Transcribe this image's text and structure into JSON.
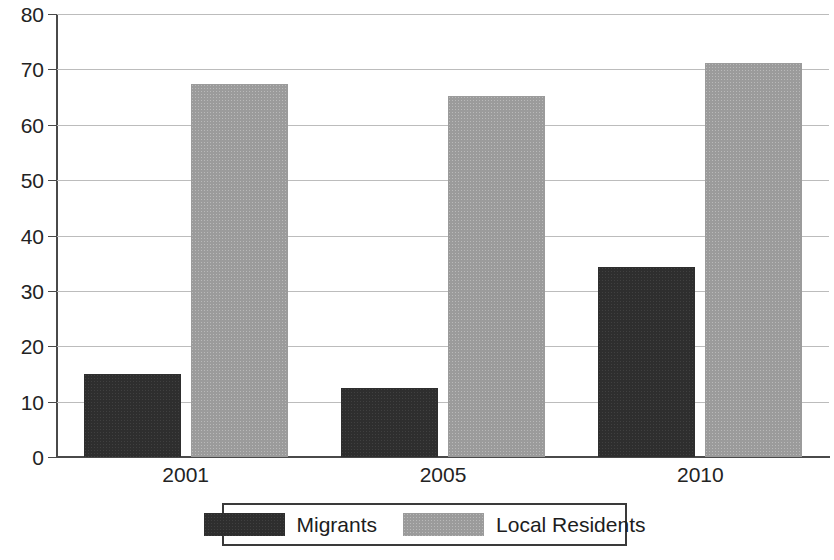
{
  "chart_data": {
    "type": "bar",
    "title": "",
    "subtitle": "",
    "xlabel": "",
    "ylabel": "",
    "categories": [
      "2001",
      "2005",
      "2010"
    ],
    "series": [
      {
        "name": "Migrants",
        "color": "#2e2e2e",
        "values": [
          15,
          12.5,
          34.3
        ]
      },
      {
        "name": "Local Residents",
        "color": "#9b9b9b",
        "values": [
          67.3,
          65.2,
          71.2
        ]
      }
    ],
    "ylim": [
      0,
      80
    ],
    "yticks": [
      0,
      10,
      20,
      30,
      40,
      50,
      60,
      70,
      80
    ],
    "ytick_labels": [
      "0",
      "10",
      "20",
      "30",
      "40",
      "50",
      "60",
      "70",
      "80"
    ],
    "grid": true,
    "legend_position": "bottom"
  },
  "legend": {
    "entries": [
      {
        "label": "Migrants",
        "swatch": "dark-swatch"
      },
      {
        "label": "Local Residents",
        "swatch": "light-swatch"
      }
    ]
  },
  "axes": {
    "x_tick_labels": [
      "2001",
      "2005",
      "2010"
    ],
    "y_tick_labels": [
      "0",
      "10",
      "20",
      "30",
      "40",
      "50",
      "60",
      "70",
      "80"
    ]
  },
  "colors": {
    "migrants": "#2e2e2e",
    "local_residents": "#9b9b9b",
    "axis": "#4a4a4a",
    "gridline": "#bcbcbc",
    "background": "#ffffff"
  }
}
